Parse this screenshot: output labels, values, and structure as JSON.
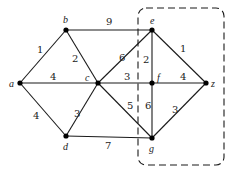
{
  "diagram": {
    "type": "weighted-graph",
    "nodes": [
      {
        "id": "a",
        "label": "a",
        "x": 20,
        "y": 83,
        "lx": 9,
        "ly": 87
      },
      {
        "id": "b",
        "label": "b",
        "x": 66,
        "y": 30,
        "lx": 63,
        "ly": 23
      },
      {
        "id": "c",
        "label": "c",
        "x": 98,
        "y": 83,
        "lx": 85,
        "ly": 81
      },
      {
        "id": "d",
        "label": "d",
        "x": 66,
        "y": 136,
        "lx": 63,
        "ly": 150
      },
      {
        "id": "e",
        "label": "e",
        "x": 152,
        "y": 30,
        "lx": 150,
        "ly": 24
      },
      {
        "id": "f",
        "label": "f",
        "x": 152,
        "y": 83,
        "lx": 157,
        "ly": 81
      },
      {
        "id": "z",
        "label": "z",
        "x": 206,
        "y": 83,
        "lx": 211,
        "ly": 87
      },
      {
        "id": "g",
        "label": "g",
        "x": 152,
        "y": 138,
        "lx": 149,
        "ly": 152
      }
    ],
    "edges": [
      {
        "from": "a",
        "to": "b",
        "weight": "1",
        "lx": 37,
        "ly": 53
      },
      {
        "from": "a",
        "to": "c",
        "weight": "4",
        "lx": 50,
        "ly": 80
      },
      {
        "from": "a",
        "to": "d",
        "weight": "4",
        "lx": 33,
        "ly": 119
      },
      {
        "from": "b",
        "to": "c",
        "weight": "2",
        "lx": 72,
        "ly": 62
      },
      {
        "from": "b",
        "to": "e",
        "weight": "9",
        "lx": 106,
        "ly": 25
      },
      {
        "from": "c",
        "to": "e",
        "weight": "6",
        "lx": 119,
        "ly": 61
      },
      {
        "from": "c",
        "to": "f",
        "weight": "3",
        "lx": 124,
        "ly": 80
      },
      {
        "from": "c",
        "to": "d",
        "weight": "3",
        "lx": 74,
        "ly": 117
      },
      {
        "from": "c",
        "to": "g",
        "weight": "5",
        "lx": 127,
        "ly": 109
      },
      {
        "from": "d",
        "to": "g",
        "weight": "7",
        "lx": 105,
        "ly": 149
      },
      {
        "from": "e",
        "to": "f",
        "weight": "2",
        "lx": 143,
        "ly": 63
      },
      {
        "from": "e",
        "to": "z",
        "weight": "1",
        "lx": 180,
        "ly": 52
      },
      {
        "from": "f",
        "to": "z",
        "weight": "4",
        "lx": 180,
        "ly": 80
      },
      {
        "from": "f",
        "to": "g",
        "weight": "6",
        "lx": 145,
        "ly": 109
      },
      {
        "from": "g",
        "to": "z",
        "weight": "3",
        "lx": 172,
        "ly": 113
      }
    ],
    "highlight_region": {
      "style": "dashed-rounded-rectangle",
      "x": 138,
      "y": 8,
      "width": 86,
      "height": 157,
      "rx": 8,
      "contains": [
        "e",
        "f",
        "z",
        "g"
      ]
    },
    "colors": {
      "stroke": "#1a1a1a",
      "node": "#000000",
      "text": "#222222",
      "background": "#ffffff"
    }
  }
}
